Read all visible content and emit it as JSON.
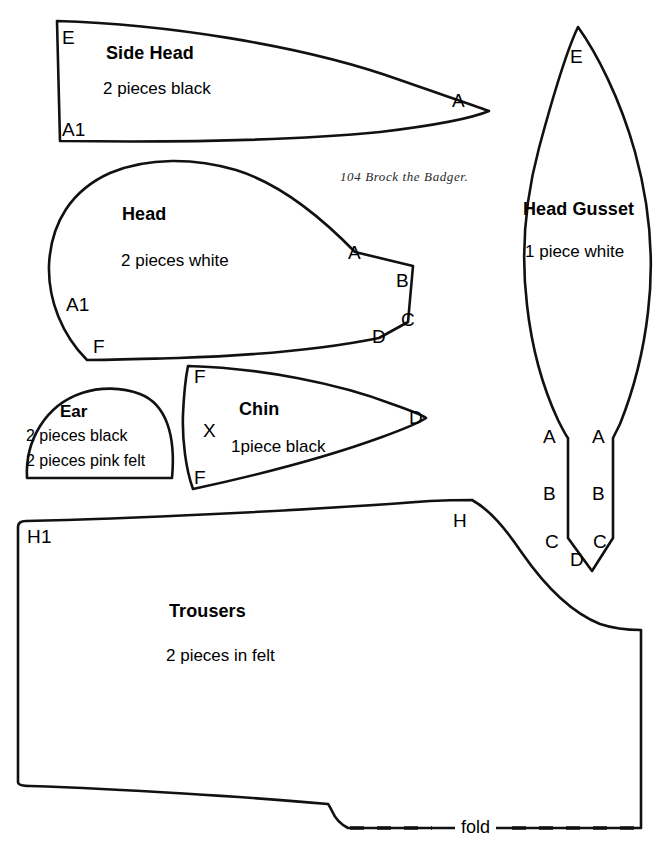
{
  "page": {
    "header": "104  Brock the Badger.",
    "background_color": "#ffffff",
    "ink_color": "#111111"
  },
  "pieces": [
    {
      "id": "side-head",
      "title": "Side Head",
      "subtitle": "2 pieces  black",
      "markers": [
        "E",
        "A1",
        "A"
      ]
    },
    {
      "id": "head",
      "title": "Head",
      "subtitle": "2 pieces  white",
      "markers": [
        "A1",
        "F",
        "A",
        "B",
        "C",
        "D"
      ]
    },
    {
      "id": "ear",
      "title": "Ear",
      "subtitle_1": "2 pieces  black",
      "subtitle_2": "2 pieces pink felt",
      "markers": []
    },
    {
      "id": "chin",
      "title": "Chin",
      "subtitle": "1piece black",
      "markers": [
        "F",
        "X",
        "F",
        "D"
      ]
    },
    {
      "id": "head-gusset",
      "title": "Head Gusset",
      "subtitle": "1 piece white",
      "markers": [
        "E",
        "A",
        "A",
        "B",
        "B",
        "C",
        "C",
        "D"
      ]
    },
    {
      "id": "trousers",
      "title": "Trousers",
      "subtitle": "2 pieces in felt",
      "markers": [
        "H1",
        "H"
      ],
      "fold_label": "fold"
    }
  ],
  "labels": {
    "side_head_title": "Side Head",
    "side_head_sub": "2 pieces  black",
    "side_head_E": "E",
    "side_head_A1": "A1",
    "side_head_A": "A",
    "head_title": "Head",
    "head_sub": "2 pieces  white",
    "head_A1": "A1",
    "head_F": "F",
    "head_A": "A",
    "head_B": "B",
    "head_C": "C",
    "head_D": "D",
    "ear_title": "Ear",
    "ear_sub1": "2 pieces  black",
    "ear_sub2": "2 pieces pink felt",
    "chin_title": "Chin",
    "chin_sub": "1piece black",
    "chin_F_top": "F",
    "chin_X": "X",
    "chin_F_bottom": "F",
    "chin_D": "D",
    "gusset_title": "Head Gusset",
    "gusset_sub": "1 piece white",
    "gusset_E": "E",
    "gusset_A_left": "A",
    "gusset_A_right": "A",
    "gusset_B_left": "B",
    "gusset_B_right": "B",
    "gusset_C_left": "C",
    "gusset_C_right": "C",
    "gusset_D": "D",
    "trousers_title": "Trousers",
    "trousers_sub": "2 pieces in felt",
    "trousers_H1": "H1",
    "trousers_H": "H",
    "trousers_fold": "fold"
  }
}
